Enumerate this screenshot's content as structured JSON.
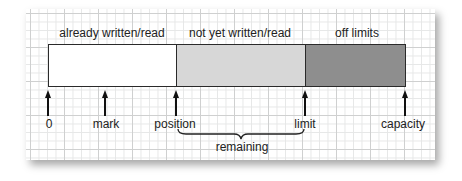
{
  "diagram": {
    "regions": [
      {
        "label": "already written/read",
        "color": "#ffffff"
      },
      {
        "label": "not yet written/read",
        "color": "#d7d7d7"
      },
      {
        "label": "off limits",
        "color": "#8e8e8e"
      }
    ],
    "markers": [
      {
        "label": "0"
      },
      {
        "label": "mark"
      },
      {
        "label": "position"
      },
      {
        "label": "limit"
      },
      {
        "label": "capacity"
      }
    ],
    "brace": {
      "label": "remaining",
      "from": "position",
      "to": "limit"
    }
  }
}
